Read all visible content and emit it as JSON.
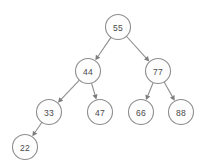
{
  "diagram": {
    "kind": "binary-search-tree",
    "title": "",
    "colors": {
      "background": "#ffffff",
      "node_fill": "#fdfdfd",
      "node_stroke": "#8e8e8e",
      "label": "#4a4a4a",
      "edge": "#8e8e8e",
      "arrowhead": "#7d7d7d"
    },
    "node_radius": 12.5,
    "nodes": [
      {
        "id": "n55",
        "label": "55",
        "x": 118,
        "y": 27,
        "level": 0,
        "role": "root"
      },
      {
        "id": "n44",
        "label": "44",
        "x": 88,
        "y": 71,
        "level": 1,
        "role": "left-child"
      },
      {
        "id": "n77",
        "label": "77",
        "x": 158,
        "y": 71,
        "level": 1,
        "role": "right-child"
      },
      {
        "id": "n33",
        "label": "33",
        "x": 49,
        "y": 112,
        "level": 2,
        "role": "left-child"
      },
      {
        "id": "n47",
        "label": "47",
        "x": 100,
        "y": 112,
        "level": 2,
        "role": "right-child"
      },
      {
        "id": "n66",
        "label": "66",
        "x": 141,
        "y": 112,
        "level": 2,
        "role": "left-child"
      },
      {
        "id": "n88",
        "label": "88",
        "x": 181,
        "y": 112,
        "level": 2,
        "role": "right-child"
      },
      {
        "id": "n22",
        "label": "22",
        "x": 25,
        "y": 147,
        "level": 3,
        "role": "left-child"
      }
    ],
    "edges": [
      {
        "id": "e55-44",
        "from": "n55",
        "to": "n44",
        "directed": true
      },
      {
        "id": "e55-77",
        "from": "n55",
        "to": "n77",
        "directed": true
      },
      {
        "id": "e44-33",
        "from": "n44",
        "to": "n33",
        "directed": true
      },
      {
        "id": "e44-47",
        "from": "n44",
        "to": "n47",
        "directed": true
      },
      {
        "id": "e77-66",
        "from": "n77",
        "to": "n66",
        "directed": true
      },
      {
        "id": "e77-88",
        "from": "n77",
        "to": "n88",
        "directed": true
      },
      {
        "id": "e33-22",
        "from": "n33",
        "to": "n22",
        "directed": true
      }
    ]
  }
}
